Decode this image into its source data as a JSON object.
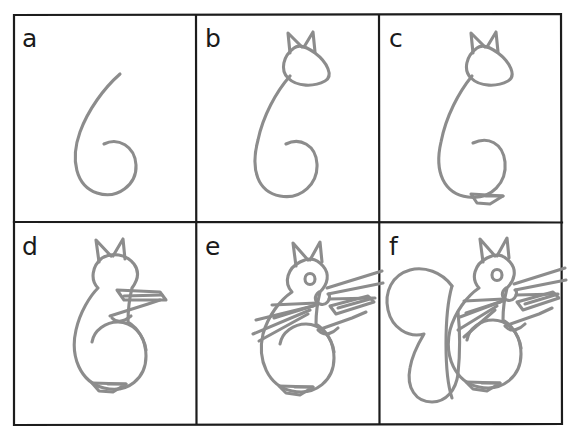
{
  "figure": {
    "kind": "step-by-step line drawing tutorial",
    "panel_count": 6,
    "grid": {
      "columns": 3,
      "rows": 2
    },
    "colors": {
      "background": "#ffffff",
      "border": "#1c1c1c",
      "stroke": "#8c8c8c",
      "label": "#1a1a1a"
    },
    "stroke_width_px": 3,
    "border_width_px": 2
  },
  "frame": {
    "x": 13,
    "y": 14,
    "width": 549,
    "height": 411,
    "divider_x": [
      196,
      379
    ],
    "divider_y": [
      222
    ]
  },
  "panels": [
    {
      "id": "a",
      "label": "a",
      "label_x": 22,
      "label_y": 26,
      "cell": {
        "x": 13,
        "y": 14,
        "width": 183,
        "height": 208
      },
      "caption": "Draw a large numeral six as the body guideline",
      "elements": [
        "body-six-stroke"
      ]
    },
    {
      "id": "b",
      "label": "b",
      "label_x": 205,
      "label_y": 26,
      "cell": {
        "x": 196,
        "y": 14,
        "width": 183,
        "height": 208
      },
      "caption": "Add a teardrop head with two pointed ears on top of the six",
      "elements": [
        "body-six-stroke",
        "head",
        "ear-left",
        "ear-right"
      ]
    },
    {
      "id": "c",
      "label": "c",
      "label_x": 389,
      "label_y": 26,
      "cell": {
        "x": 379,
        "y": 14,
        "width": 183,
        "height": 208
      },
      "caption": "Close the belly circle and add the back foot",
      "elements": [
        "body-six-stroke",
        "head",
        "ear-left",
        "ear-right",
        "belly",
        "foot"
      ]
    },
    {
      "id": "d",
      "label": "d",
      "label_x": 22,
      "label_y": 234,
      "cell": {
        "x": 13,
        "y": 222,
        "width": 183,
        "height": 203
      },
      "caption": "Outline the full body and add the two front paws",
      "elements": [
        "body-outline",
        "head",
        "ears",
        "belly",
        "foot",
        "arm-upper",
        "arm-lower"
      ]
    },
    {
      "id": "e",
      "label": "e",
      "label_x": 205,
      "label_y": 234,
      "cell": {
        "x": 196,
        "y": 222,
        "width": 183,
        "height": 203
      },
      "caption": "Add the eye, nose, whiskers and chest fur lines",
      "elements": [
        "body-outline",
        "head",
        "ears",
        "eye",
        "nose",
        "whiskers",
        "chest-fur",
        "arms",
        "foot"
      ]
    },
    {
      "id": "f",
      "label": "f",
      "label_x": 389,
      "label_y": 234,
      "cell": {
        "x": 379,
        "y": 222,
        "width": 183,
        "height": 203
      },
      "caption": "Finish with the big bushy tail curving up behind the back",
      "elements": [
        "body-outline",
        "head",
        "ears",
        "eye",
        "nose",
        "whiskers",
        "chest-fur",
        "arms",
        "foot",
        "tail"
      ]
    }
  ]
}
